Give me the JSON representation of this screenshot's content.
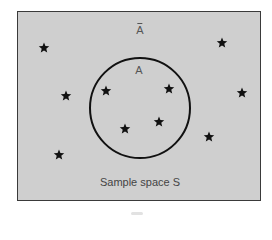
{
  "diagram": {
    "type": "venn",
    "sample_space_label": "Sample space S",
    "event_label": "A",
    "complement_label": "A",
    "complement_has_overbar": true,
    "colors": {
      "background": "#cfcfcf",
      "border": "#3a3a3a",
      "circle_stroke": "#111111",
      "star": "#111111",
      "label_text": "#555555"
    },
    "circle": {
      "cx": 140,
      "cy": 108,
      "r": 50
    },
    "stars_inside_event": [
      {
        "x": 106,
        "y": 91
      },
      {
        "x": 169,
        "y": 89
      },
      {
        "x": 125,
        "y": 129
      },
      {
        "x": 159,
        "y": 122
      }
    ],
    "stars_in_complement": [
      {
        "x": 44,
        "y": 48
      },
      {
        "x": 66,
        "y": 96
      },
      {
        "x": 59,
        "y": 155
      },
      {
        "x": 222,
        "y": 43
      },
      {
        "x": 242,
        "y": 93
      },
      {
        "x": 209,
        "y": 137
      }
    ]
  }
}
